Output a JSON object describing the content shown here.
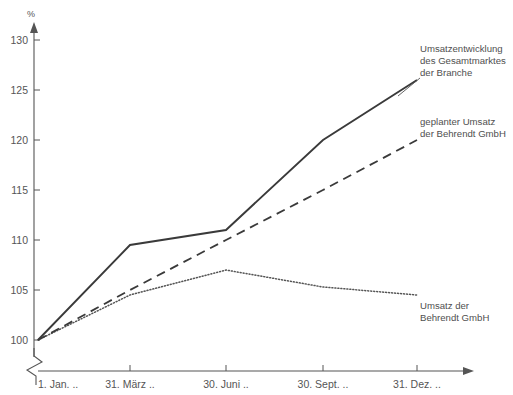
{
  "chart_data": {
    "type": "line",
    "title": "",
    "xlabel": "",
    "ylabel": "%",
    "ylim": [
      100,
      130
    ],
    "yticks": [
      100,
      105,
      110,
      115,
      120,
      125,
      130
    ],
    "ytick_labels": [
      "100",
      "105",
      "110",
      "115",
      "120",
      "125",
      "130"
    ],
    "y_axis_break": true,
    "grid": false,
    "legend_position": "inline-annotations",
    "categories": [
      "1. Jan. ..",
      "31. März ..",
      "30. Juni ..",
      "30. Sept. ..",
      "31. Dez. .."
    ],
    "series": [
      {
        "name": "Umsatzentwicklung des Gesamtmarktes der Branche",
        "style": "solid",
        "color": "#3a3a3a",
        "values": [
          100,
          109.5,
          111,
          120,
          126
        ]
      },
      {
        "name": "geplanter Umsatz der Behrendt GmbH",
        "style": "dashed",
        "color": "#3a3a3a",
        "values": [
          100,
          105,
          110,
          115,
          120
        ]
      },
      {
        "name": "Umsatz der Behrendt GmbH",
        "style": "dotted",
        "color": "#555555",
        "values": [
          100,
          104.5,
          107,
          105.3,
          104.5
        ]
      }
    ],
    "annotations": [
      {
        "id": "gesamtmarkt",
        "lines": [
          "Umsatzentwicklung",
          "des Gesamtmarktes",
          "der Branche"
        ]
      },
      {
        "id": "geplanter-umsatz",
        "lines": [
          "geplanter Umsatz",
          "der Behrendt GmbH"
        ]
      },
      {
        "id": "umsatz",
        "lines": [
          "Umsatz der",
          "Behrendt GmbH"
        ]
      }
    ]
  },
  "axis": {
    "unit_label": "%",
    "ytick_0": "100",
    "ytick_1": "105",
    "ytick_2": "110",
    "ytick_3": "115",
    "ytick_4": "120",
    "ytick_5": "125",
    "ytick_6": "130",
    "xtick_0": "1. Jan. ..",
    "xtick_1": "31. März ..",
    "xtick_2": "30. Juni ..",
    "xtick_3": "30. Sept. ..",
    "xtick_4": "31. Dez. .."
  },
  "annotations": {
    "gesamtmarkt_line1": "Umsatzentwicklung",
    "gesamtmarkt_line2": "des Gesamtmarktes",
    "gesamtmarkt_line3": "der Branche",
    "geplant_line1": "geplanter Umsatz",
    "geplant_line2": "der Behrendt GmbH",
    "umsatz_line1": "Umsatz der",
    "umsatz_line2": "Behrendt GmbH"
  }
}
